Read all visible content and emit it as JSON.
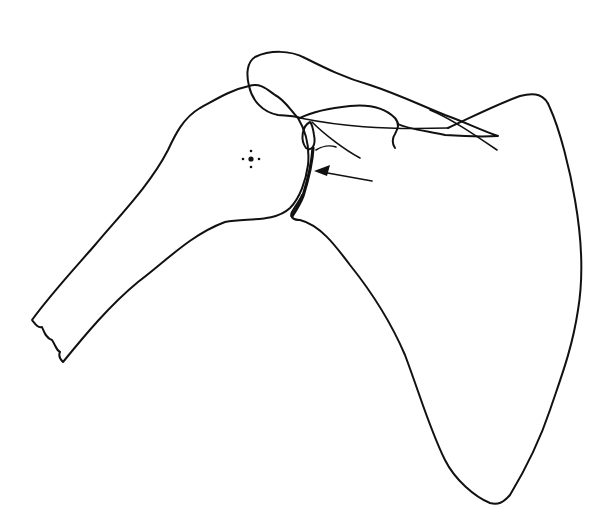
{
  "diagram": {
    "parts": [
      {
        "id": "humerus",
        "label": "Humerus outline"
      },
      {
        "id": "scapula",
        "label": "Scapula outline"
      },
      {
        "id": "acromion",
        "label": "Acromion outline"
      },
      {
        "id": "glenoid",
        "label": "Glenoid rim"
      },
      {
        "id": "center-marker",
        "label": "Humeral head center marker"
      },
      {
        "id": "arrow",
        "label": "Arrow pointing to glenoid"
      }
    ],
    "stroke_color": "#111111",
    "background_color": "#ffffff"
  }
}
